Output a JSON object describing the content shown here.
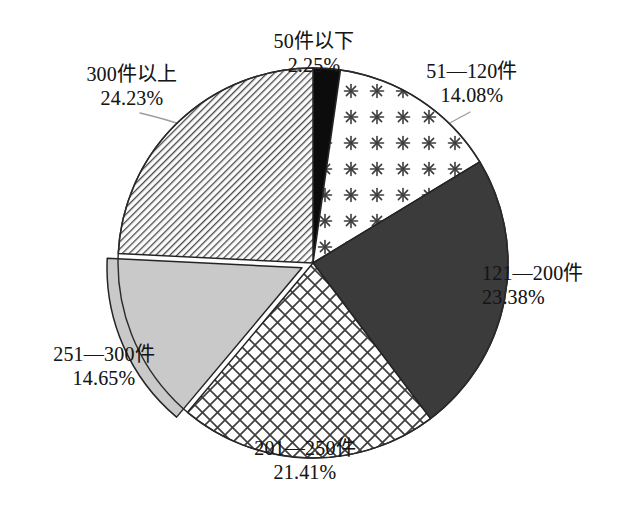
{
  "chart_data": {
    "type": "pie",
    "title": "",
    "subtitle": "",
    "xlabel": "",
    "ylabel": "",
    "legend_position": "none",
    "grid": false,
    "start_angle_deg": 0,
    "direction": "clockwise",
    "value_unit": "%",
    "categories": [
      "50件以下",
      "51—120件",
      "121—200件",
      "201—250件",
      "251—300件",
      "300件以上"
    ],
    "values": [
      2.25,
      14.08,
      23.38,
      21.41,
      14.65,
      24.23
    ],
    "labels": [
      {
        "name": "50件以下",
        "value": 2.25,
        "value_text": "2.25%",
        "pattern": "solid-black",
        "color": "#0c0c0c",
        "exploded": false
      },
      {
        "name": "51—120件",
        "value": 14.08,
        "value_text": "14.08%",
        "pattern": "asterisk-dots",
        "color": "#fdfdfd",
        "exploded": false
      },
      {
        "name": "121—200件",
        "value": 23.38,
        "value_text": "23.38%",
        "pattern": "solid-dark-gray",
        "color": "#3b3b3b",
        "exploded": false
      },
      {
        "name": "201—250件",
        "value": 21.41,
        "value_text": "21.41%",
        "pattern": "crosshatch",
        "color": "#ffffff",
        "exploded": false
      },
      {
        "name": "251—300件",
        "value": 14.65,
        "value_text": "14.65%",
        "pattern": "solid-light-gray",
        "color": "#c9c9c9",
        "exploded": true
      },
      {
        "name": "300件以上",
        "value": 24.23,
        "value_text": "24.23%",
        "pattern": "diagonal-hatch",
        "color": "#d8d8d8",
        "exploded": false
      }
    ]
  },
  "slices": {
    "s1": {
      "label": "50件以下",
      "percent": "2.25%"
    },
    "s2": {
      "label": "51—120件",
      "percent": "14.08%"
    },
    "s3": {
      "label": "121—200件",
      "percent": "23.38%"
    },
    "s4": {
      "label": "201—250件",
      "percent": "21.41%"
    },
    "s5": {
      "label": "251—300件",
      "percent": "14.65%"
    },
    "s6": {
      "label": "300件以上",
      "percent": "24.23%"
    }
  },
  "colors": {
    "background": "#ffffff",
    "outline": "#2a2a2a",
    "leader_line": "#9a9a9a",
    "text": "#161616",
    "black_slice": "#0c0c0c",
    "dark_gray_slice": "#3b3b3b",
    "light_gray_slice": "#c9c9c9",
    "hatch_ink": "#4a4a4a"
  }
}
